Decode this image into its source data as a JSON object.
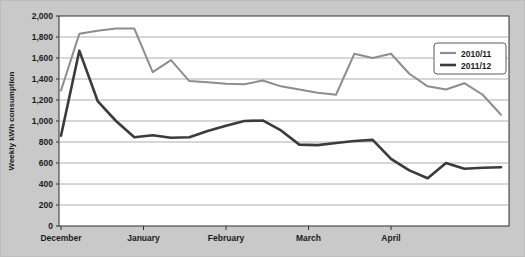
{
  "chart_data": {
    "type": "line",
    "title": "",
    "subtitle": "",
    "xlabel": "",
    "ylabel": "Weekly kWh consumption",
    "ylim": [
      0,
      2000
    ],
    "ytick_step": 200,
    "ytick_labels": [
      "0",
      "200",
      "400",
      "600",
      "800",
      "1,000",
      "1,200",
      "1,400",
      "1,600",
      "1,800",
      "2,000"
    ],
    "ytick_values": [
      0,
      200,
      400,
      600,
      800,
      1000,
      1200,
      1400,
      1600,
      1800,
      2000
    ],
    "xtick_labels": [
      "December",
      "January",
      "February",
      "March",
      "April"
    ],
    "xtick_weeks": [
      1,
      5.5,
      10,
      14.5,
      19
    ],
    "x_unit": "week",
    "grid": "horizontal",
    "legend_position": "top-right",
    "legend": [
      "2010/11",
      "2011/12"
    ],
    "series": [
      {
        "name": "2010/11",
        "color": "#8d8d8d",
        "values": [
          1290,
          1830,
          1860,
          1880,
          1880,
          1465,
          1580,
          1380,
          1370,
          1355,
          1350,
          1385,
          1330,
          1300,
          1270,
          1250,
          1640,
          1600,
          1640,
          1450,
          1330,
          1300,
          1360,
          1250,
          1060
        ]
      },
      {
        "name": "2011/12",
        "color": "#3b3b3b",
        "values": [
          860,
          1670,
          1190,
          1000,
          845,
          865,
          840,
          845,
          905,
          955,
          1000,
          1005,
          910,
          775,
          770,
          790,
          810,
          820,
          640,
          530,
          455,
          600,
          545,
          555,
          560
        ]
      }
    ]
  },
  "axis": {
    "y_title": "Weekly kWh consumption"
  },
  "legend": {
    "items": [
      {
        "label": "2010/11",
        "color": "#8d8d8d"
      },
      {
        "label": "2011/12",
        "color": "#3b3b3b"
      }
    ]
  }
}
